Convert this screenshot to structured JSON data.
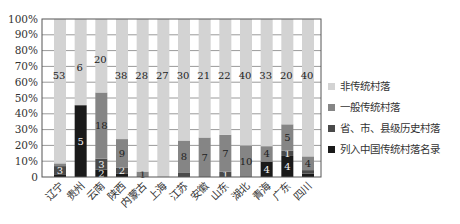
{
  "chart_data": {
    "type": "bar",
    "stacked": "percent",
    "title": "",
    "xlabel": "",
    "ylabel": "",
    "ylim": [
      0,
      100
    ],
    "yticks": [
      "0",
      "10%",
      "20%",
      "30%",
      "40%",
      "50%",
      "60%",
      "70%",
      "80%",
      "90%",
      "100%"
    ],
    "grid": true,
    "legend_position": "right",
    "categories": [
      "辽宁",
      "贵州",
      "云南",
      "陕西",
      "内蒙古",
      "上海",
      "江苏",
      "安徽",
      "山东",
      "湖北",
      "青海",
      "广东",
      "四川"
    ],
    "series": [
      {
        "name": "列入中国传统村落名录",
        "color": "#1a1a1a",
        "values": [
          1,
          5,
          2,
          1,
          0,
          0,
          0,
          0,
          0,
          0,
          4,
          4,
          1
        ]
      },
      {
        "name": "省、市、县级历史村落",
        "color": "#4a4a4a",
        "values": [
          3,
          0,
          3,
          2,
          0,
          0,
          1,
          0,
          1,
          0,
          0,
          1,
          1
        ]
      },
      {
        "name": "一般传统村落",
        "color": "#858585",
        "values": [
          1,
          0,
          18,
          9,
          1,
          0,
          8,
          7,
          7,
          10,
          4,
          5,
          4
        ]
      },
      {
        "name": "非传统村落",
        "color": "#d3d3d3",
        "values": [
          53,
          6,
          20,
          38,
          28,
          27,
          30,
          21,
          22,
          40,
          33,
          20,
          40
        ]
      }
    ]
  },
  "legend": {
    "items": [
      {
        "label": "非传统村落",
        "color": "#d3d3d3"
      },
      {
        "label": "一般传统村落",
        "color": "#858585"
      },
      {
        "label": "省、市、县级历史村落",
        "color": "#4a4a4a"
      },
      {
        "label": "列入中国传统村落名录",
        "color": "#1a1a1a"
      }
    ]
  }
}
